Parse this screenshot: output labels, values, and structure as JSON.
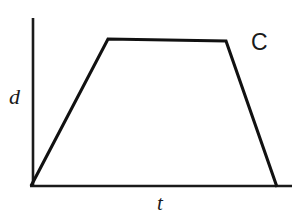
{
  "figure": {
    "id_label": "C",
    "background_color": "#ffffff",
    "stroke_color": "#111111",
    "width": 300,
    "height": 224
  },
  "axes": {
    "y_axis_label": "d",
    "x_axis_label": "t",
    "y_axis": {
      "x": 33,
      "y_top": 18,
      "y_bottom": 186
    },
    "x_axis": {
      "y": 186,
      "x_left": 30,
      "x_right": 292
    },
    "ticks": [],
    "grid": false
  },
  "chart_data": {
    "type": "line",
    "title": "",
    "subtitle": "",
    "xlabel": "t",
    "ylabel": "d",
    "xlim": [
      0,
      1
    ],
    "ylim": [
      0,
      1
    ],
    "grid": false,
    "legend": null,
    "annotations": [
      {
        "text": "C",
        "x_px": 260,
        "y_px": 44
      }
    ],
    "series": [
      {
        "name": "d vs t",
        "shape": "trapezoid",
        "description": "Rises linearly from origin, holds constant plateau, then falls linearly back to the time axis",
        "points_px": [
          {
            "x": 31,
            "y": 186
          },
          {
            "x": 108,
            "y": 39
          },
          {
            "x": 226,
            "y": 41
          },
          {
            "x": 277,
            "y": 187
          }
        ],
        "x": [
          0.0,
          0.295,
          0.748,
          0.944
        ],
        "values": [
          0.0,
          0.875,
          0.863,
          0.0
        ]
      }
    ]
  }
}
